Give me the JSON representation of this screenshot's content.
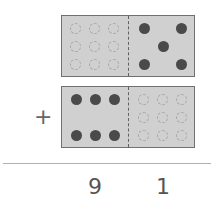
{
  "problem": {
    "operator": "+",
    "top_domino": {
      "left_dots": 0,
      "right_dots": 5,
      "left_empty_grid": 9
    },
    "bottom_domino": {
      "left_dots": 6,
      "right_dots": 0,
      "right_empty_grid": 9
    },
    "answer_tens": "9",
    "answer_ones": "1"
  },
  "colors": {
    "domino_fill": "#d0d0d0",
    "dot": "#4a4a4a",
    "empty_dot": "#a8a8a8"
  }
}
